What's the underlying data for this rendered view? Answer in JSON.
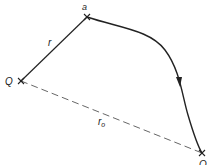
{
  "diagram": {
    "points": {
      "start": {
        "label": "Q",
        "x": 21,
        "y": 81
      },
      "a": {
        "label": "a",
        "x": 87,
        "y": 17
      },
      "end": {
        "label": "Q",
        "x": 202,
        "y": 153
      }
    },
    "labels": {
      "r": "r",
      "r0_main": "r",
      "r0_sub": "o"
    },
    "colors": {
      "line": "#222222",
      "dashed": "#555555"
    }
  }
}
